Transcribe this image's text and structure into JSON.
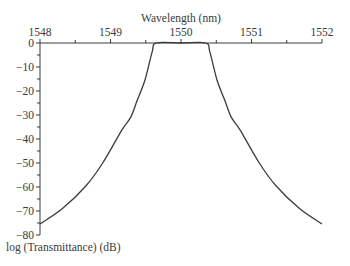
{
  "chart_data": {
    "type": "line",
    "title": "",
    "xlabel": "Wavelength (nm)",
    "ylabel": "log (Transmittance) (dB)",
    "xlim": [
      1548,
      1552
    ],
    "ylim": [
      -80,
      0
    ],
    "x_ticks": [
      1548,
      1549,
      1550,
      1551,
      1552
    ],
    "x_minor_step": 0.5,
    "y_ticks": [
      0,
      -10,
      -20,
      -30,
      -40,
      -50,
      -60,
      -70,
      -80
    ],
    "y_minor_step": 5,
    "x_axis_position": "top",
    "grid": false,
    "legend": null,
    "series": [
      {
        "name": "Transmittance",
        "color": "#3a3a3a",
        "x": [
          1548.0,
          1548.31,
          1548.65,
          1548.89,
          1549.16,
          1549.29,
          1549.38,
          1549.49,
          1549.59,
          1549.65,
          1550.0,
          1550.35,
          1550.41,
          1550.51,
          1550.62,
          1550.71,
          1550.84,
          1551.11,
          1551.35,
          1551.69,
          1552.0
        ],
        "y": [
          -75.4,
          -69.2,
          -59.6,
          -50.0,
          -36.3,
          -30.8,
          -23.8,
          -15.4,
          -3.8,
          0,
          0,
          0,
          -3.8,
          -15.4,
          -23.8,
          -30.8,
          -36.3,
          -50.0,
          -59.6,
          -69.2,
          -75.4
        ]
      }
    ]
  },
  "labels": {
    "xlabel": "Wavelength (nm)",
    "ylabel": "log (Transmittance) (dB)",
    "x_ticks": [
      "1548",
      "1549",
      "1550",
      "1551",
      "1552"
    ],
    "y_ticks": [
      "0",
      "−10",
      "−20",
      "−30",
      "−40",
      "−50",
      "−60",
      "−70",
      "−80"
    ]
  },
  "colors": {
    "axis": "#3a3a3a",
    "line": "#3a3a3a",
    "background": "#ffffff"
  }
}
